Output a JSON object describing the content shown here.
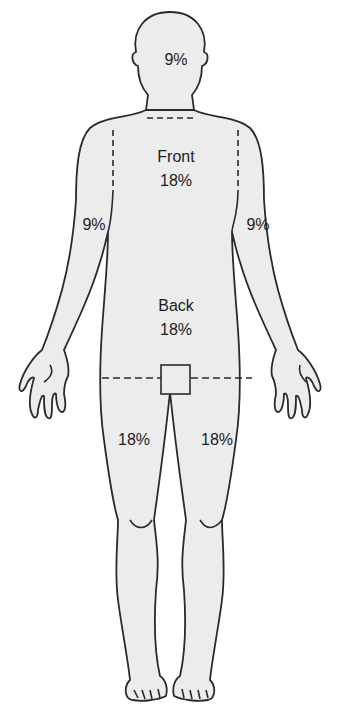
{
  "diagram": {
    "colors": {
      "fill": "#ececec",
      "outline": "#2a2a2a",
      "background": "#ffffff"
    },
    "labels": {
      "head": "9%",
      "front_title": "Front",
      "front_value": "18%",
      "left_arm": "9%",
      "right_arm": "9%",
      "back_title": "Back",
      "back_value": "18%",
      "left_leg": "18%",
      "right_leg": "18%"
    }
  }
}
